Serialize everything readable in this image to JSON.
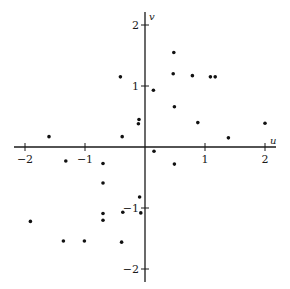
{
  "chart_data": {
    "type": "scatter",
    "title": "",
    "xlabel": "u",
    "ylabel": "v",
    "xlim": [
      -2.1,
      2.2
    ],
    "ylim": [
      -2.1,
      2.2
    ],
    "grid": false,
    "legend": "none",
    "xticks": [
      -2,
      -1,
      1,
      2
    ],
    "xtick_labels": [
      "−2",
      "−1",
      "1",
      "2"
    ],
    "yticks": [
      2,
      1,
      -1,
      -2
    ],
    "ytick_labels": [
      "2",
      "1",
      "−1",
      "−2"
    ],
    "points": [
      {
        "u": 0.48,
        "v": 1.55
      },
      {
        "u": -0.41,
        "v": 1.15
      },
      {
        "u": 0.47,
        "v": 1.2
      },
      {
        "u": 0.79,
        "v": 1.17
      },
      {
        "u": 1.09,
        "v": 1.15
      },
      {
        "u": 1.17,
        "v": 1.15
      },
      {
        "u": 0.14,
        "v": 0.93
      },
      {
        "u": 0.49,
        "v": 0.66
      },
      {
        "u": -0.1,
        "v": 0.45
      },
      {
        "u": -0.11,
        "v": 0.38
      },
      {
        "u": 0.88,
        "v": 0.4
      },
      {
        "u": 2.0,
        "v": 0.39
      },
      {
        "u": -1.6,
        "v": 0.17
      },
      {
        "u": -0.38,
        "v": 0.17
      },
      {
        "u": 1.39,
        "v": 0.15
      },
      {
        "u": 0.15,
        "v": -0.07
      },
      {
        "u": -1.32,
        "v": -0.23
      },
      {
        "u": -0.7,
        "v": -0.27
      },
      {
        "u": 0.49,
        "v": -0.28
      },
      {
        "u": -0.7,
        "v": -0.59
      },
      {
        "u": -0.09,
        "v": -0.82
      },
      {
        "u": -0.37,
        "v": -1.07
      },
      {
        "u": -0.07,
        "v": -1.08
      },
      {
        "u": -0.7,
        "v": -1.09
      },
      {
        "u": -0.7,
        "v": -1.2
      },
      {
        "u": -1.91,
        "v": -1.22
      },
      {
        "u": -1.36,
        "v": -1.54
      },
      {
        "u": -1.01,
        "v": -1.54
      },
      {
        "u": -0.39,
        "v": -1.56
      }
    ]
  }
}
